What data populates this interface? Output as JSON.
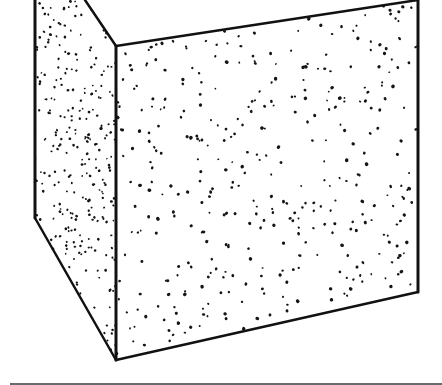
{
  "image": {
    "subject": "Stippled ink drawing of a cube (box) seen from a low angle",
    "width": 442,
    "height": 385,
    "background": "#ffffff",
    "ink_color": "#111111",
    "floor_line_color": "#6b6b6b"
  },
  "cube": {
    "left_face": {
      "points": [
        [
          35,
          0
        ],
        [
          85,
          0
        ],
        [
          116,
          46
        ],
        [
          116,
          360
        ],
        [
          35,
          218
        ]
      ],
      "stipple_density": 0.012,
      "seed": 11
    },
    "front_face": {
      "points": [
        [
          116,
          46
        ],
        [
          418,
          0
        ],
        [
          418,
          292
        ],
        [
          116,
          360
        ]
      ],
      "stipple_density": 0.0042,
      "seed": 29
    },
    "edges": [
      {
        "name": "left-vertical-edge",
        "from": [
          35,
          0
        ],
        "to": [
          35,
          218
        ],
        "width": 3
      },
      {
        "name": "left-bottom-diagonal-edge",
        "from": [
          35,
          218
        ],
        "to": [
          116,
          360
        ],
        "width": 2.5
      },
      {
        "name": "top-diagonal-edge",
        "from": [
          85,
          0
        ],
        "to": [
          116,
          46
        ],
        "width": 2.5
      },
      {
        "name": "front-left-vertical-edge",
        "from": [
          116,
          46
        ],
        "to": [
          116,
          360
        ],
        "width": 3
      },
      {
        "name": "front-top-edge",
        "from": [
          116,
          46
        ],
        "to": [
          418,
          0
        ],
        "width": 2.5
      },
      {
        "name": "front-right-vertical-edge",
        "from": [
          418,
          0
        ],
        "to": [
          418,
          292
        ],
        "width": 3
      },
      {
        "name": "front-bottom-edge",
        "from": [
          116,
          360
        ],
        "to": [
          418,
          292
        ],
        "width": 2.5
      }
    ]
  }
}
